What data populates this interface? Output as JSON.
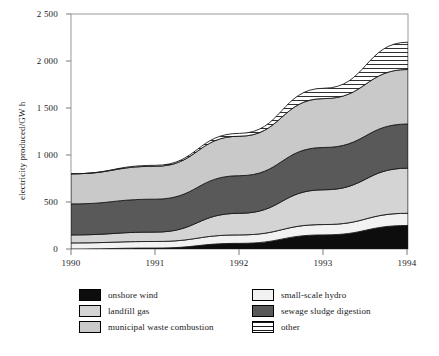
{
  "chart_data": {
    "type": "area",
    "stacked": true,
    "title": "",
    "subtitle": "",
    "xlabel": "",
    "ylabel": "electricity produced/GW h",
    "x": [
      1990,
      1991,
      1992,
      1993,
      1994
    ],
    "categories": [
      "1990",
      "1991",
      "1992",
      "1993",
      "1994"
    ],
    "xtick_labels": [
      "1990",
      "1991",
      "1992",
      "1993",
      "1994"
    ],
    "ytick_labels": [
      "0",
      "500",
      "1 000",
      "1 500",
      "2 000",
      "2 500"
    ],
    "ytick_values": [
      0,
      500,
      1000,
      1500,
      2000,
      2500
    ],
    "ylim": [
      0,
      2500
    ],
    "xlim": [
      1990,
      1994
    ],
    "grid": false,
    "legend_position": "bottom",
    "series": [
      {
        "name": "onshore wind",
        "fill": "#0d0d0d",
        "pattern": "solid",
        "values": [
          0,
          10,
          60,
          150,
          250
        ]
      },
      {
        "name": "small-scale hydro",
        "fill": "#f2f2f2",
        "pattern": "solid",
        "values": [
          65,
          70,
          90,
          110,
          130
        ]
      },
      {
        "name": "landfill gas",
        "fill": "#d4d4d4",
        "pattern": "solid",
        "values": [
          85,
          100,
          230,
          370,
          480
        ]
      },
      {
        "name": "sewage sludge digestion",
        "fill": "#595959",
        "pattern": "solid",
        "values": [
          330,
          350,
          400,
          450,
          470
        ]
      },
      {
        "name": "municipal waste combustion",
        "fill": "#c9c9c9",
        "pattern": "solid",
        "values": [
          320,
          350,
          420,
          520,
          580
        ]
      },
      {
        "name": "other",
        "fill": "#ffffff",
        "pattern": "horizontal-hatch",
        "values": [
          0,
          10,
          30,
          110,
          290
        ]
      }
    ],
    "totals": [
      800,
      880,
      1230,
      1700,
      2200
    ]
  },
  "legend": {
    "left_column": [
      {
        "label": "onshore wind",
        "swatch": "onshore-wind-swatch"
      },
      {
        "label": "landfill gas",
        "swatch": "landfill-gas-swatch"
      },
      {
        "label": "municipal waste combustion",
        "swatch": "municipal-waste-combustion-swatch"
      }
    ],
    "right_column": [
      {
        "label": "small-scale hydro",
        "swatch": "small-scale-hydro-swatch"
      },
      {
        "label": "sewage sludge digestion",
        "swatch": "sewage-sludge-digestion-swatch"
      },
      {
        "label": "other",
        "swatch": "other-swatch"
      }
    ]
  },
  "colors": {
    "onshore_wind": "#0d0d0d",
    "small_scale_hydro": "#f2f2f2",
    "landfill_gas": "#d4d4d4",
    "sewage_sludge_digestion": "#595959",
    "municipal_waste_combustion": "#c9c9c9",
    "other": "#ffffff",
    "axis": "#8c8c8c",
    "outline": "#000000",
    "background": "#ffffff"
  }
}
